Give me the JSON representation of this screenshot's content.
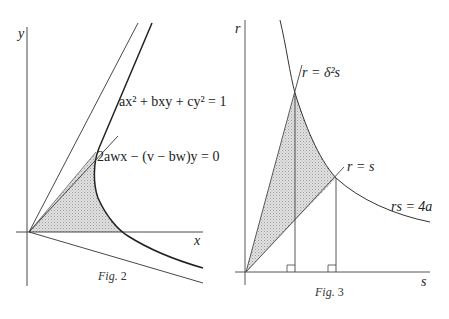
{
  "figures": [
    {
      "id": "fig2",
      "caption_prefix": "Fig.",
      "caption_number": "2",
      "axes": {
        "x_label": "x",
        "y_label": "y"
      },
      "equations": {
        "conic": "ax² + bxy + cy² = 1",
        "chord": "2awx − (v − bw)y = 0"
      },
      "elements": [
        "y-axis",
        "x-axis",
        "upper asymptote",
        "lower asymptote",
        "hyperbola branch",
        "chord line from origin",
        "shaded region between chord, hyperbola and x-axis"
      ]
    },
    {
      "id": "fig3",
      "caption_prefix": "Fig.",
      "caption_number": "3",
      "axes": {
        "x_label": "s",
        "y_label": "r"
      },
      "equations": {
        "steep_line": "r = δ²s",
        "diagonal_line": "r = s",
        "hyperbola": "rs = 4a"
      },
      "elements": [
        "r-axis",
        "s-axis",
        "hyperbola rs = 4a",
        "line r = δ²s",
        "line r = s",
        "two vertical drop lines with right-angle markers",
        "shaded curvilinear triangle"
      ]
    }
  ],
  "colors": {
    "ink": "#222222",
    "shade": "#d6d6d6",
    "background": "#ffffff"
  }
}
